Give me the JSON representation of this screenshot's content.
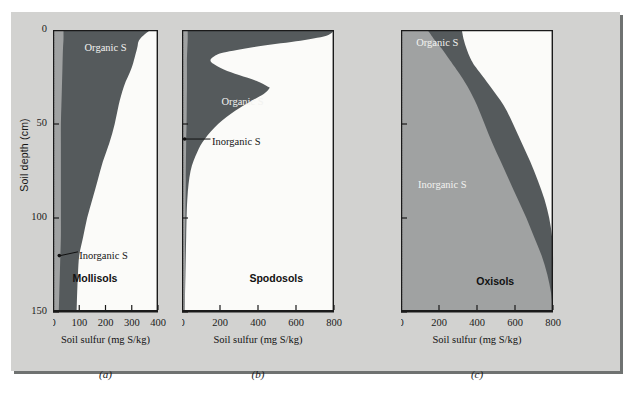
{
  "figure": {
    "y_axis_title": "Soil depth (cm)",
    "y_ticks": [
      "0",
      "50",
      "100",
      "150"
    ],
    "x_axis_title": "Soil sulfur (mg S/kg)",
    "colors": {
      "figure_background": "#d2d2d0",
      "organic_fill": "#555a5c",
      "inorganic_fill": "#a0a2a2",
      "plot_white": "#fbfbf9",
      "axis_line": "#1a1a1a"
    }
  },
  "panels": [
    {
      "caption": "(a)",
      "soil_type": "Mollisols",
      "organic_label": "Organic S",
      "inorganic_label": "Inorganic S",
      "x_ticks": [
        "0",
        "100",
        "200",
        "300",
        "400"
      ]
    },
    {
      "caption": "(b)",
      "soil_type": "Spodosols",
      "organic_label": "Organic S",
      "inorganic_label": "Inorganic S",
      "x_ticks": [
        "0",
        "200",
        "400",
        "600",
        "800"
      ]
    },
    {
      "caption": "(c)",
      "soil_type": "Oxisols",
      "organic_label": "Organic S",
      "inorganic_label": "Inorganic S",
      "x_ticks": [
        "0",
        "200",
        "400",
        "600",
        "800"
      ]
    }
  ],
  "chart_data": [
    {
      "type": "area",
      "title": "Mollisols",
      "panel": "(a)",
      "xlabel": "Soil sulfur (mg S/kg)",
      "ylabel": "Soil depth (cm)",
      "xlim": [
        0,
        400
      ],
      "ylim": [
        0,
        150
      ],
      "y_inverted": true,
      "xticks": [
        0,
        100,
        200,
        300,
        400
      ],
      "yticks": [
        0,
        50,
        100,
        150
      ],
      "grid": false,
      "legend": "in-plot annotations",
      "series": [
        {
          "name": "Inorganic S",
          "note": "narrow band along left axis; boundary x at each depth",
          "depth_cm": [
            0,
            5,
            10,
            20,
            30,
            40,
            50,
            60,
            70,
            80,
            90,
            100,
            110,
            120,
            130,
            140,
            150
          ],
          "values": [
            40,
            40,
            38,
            36,
            34,
            32,
            30,
            30,
            30,
            30,
            30,
            30,
            30,
            28,
            26,
            24,
            22
          ]
        },
        {
          "name": "Organic S",
          "note": "cumulative outer boundary (total S): organic occupies region between inorganic boundary and this curve",
          "depth_cm": [
            0,
            5,
            10,
            20,
            30,
            40,
            50,
            60,
            70,
            80,
            90,
            100,
            110,
            120,
            130,
            140,
            150
          ],
          "values": [
            370,
            330,
            320,
            300,
            270,
            250,
            235,
            215,
            190,
            170,
            150,
            130,
            115,
            100,
            95,
            92,
            90
          ]
        }
      ]
    },
    {
      "type": "area",
      "title": "Spodosols",
      "panel": "(b)",
      "xlabel": "Soil sulfur (mg S/kg)",
      "ylabel": "Soil depth (cm)",
      "xlim": [
        0,
        800
      ],
      "ylim": [
        0,
        150
      ],
      "y_inverted": true,
      "xticks": [
        0,
        200,
        400,
        600,
        800
      ],
      "yticks": [
        0,
        50,
        100,
        150
      ],
      "grid": false,
      "legend": "in-plot annotations",
      "series": [
        {
          "name": "Inorganic S",
          "note": "very narrow band hugging the left axis",
          "depth_cm": [
            0,
            5,
            10,
            15,
            20,
            25,
            30,
            40,
            50,
            60,
            80,
            100,
            120,
            150
          ],
          "values": [
            30,
            30,
            28,
            26,
            26,
            26,
            26,
            25,
            24,
            22,
            20,
            18,
            16,
            14
          ]
        },
        {
          "name": "Organic S",
          "note": "bimodal: surface maximum ~800, minimum ~150 near 16 cm, second (spodic) peak ~460 near 31 cm, decays to near zero by 75 cm",
          "depth_cm": [
            0,
            3,
            6,
            9,
            12,
            14,
            16,
            18,
            21,
            24,
            27,
            30,
            31,
            34,
            38,
            43,
            50,
            58,
            65,
            75,
            90,
            110,
            130,
            150
          ],
          "values": [
            800,
            760,
            600,
            380,
            220,
            170,
            150,
            165,
            220,
            300,
            390,
            450,
            460,
            430,
            360,
            280,
            190,
            120,
            80,
            45,
            28,
            22,
            18,
            14
          ]
        }
      ]
    },
    {
      "type": "area",
      "title": "Oxisols",
      "panel": "(c)",
      "xlabel": "Soil sulfur (mg S/kg)",
      "ylabel": "Soil depth (cm)",
      "xlim": [
        0,
        800
      ],
      "ylim": [
        0,
        150
      ],
      "y_inverted": true,
      "xticks": [
        0,
        200,
        400,
        600,
        800
      ],
      "yticks": [
        0,
        50,
        100,
        150
      ],
      "grid": false,
      "legend": "in-plot annotations",
      "series": [
        {
          "name": "Inorganic S",
          "note": "dominant fill increasing with depth; boundary between inorganic and organic",
          "depth_cm": [
            0,
            5,
            10,
            15,
            20,
            30,
            40,
            50,
            60,
            70,
            80,
            90,
            100,
            110,
            120,
            130,
            140,
            150
          ],
          "values": [
            140,
            175,
            215,
            250,
            285,
            350,
            400,
            440,
            480,
            525,
            570,
            615,
            660,
            700,
            740,
            770,
            790,
            800
          ]
        },
        {
          "name": "Organic S",
          "note": "outer total-S boundary; organic is the dark band between the inorganic boundary and this curve",
          "depth_cm": [
            0,
            5,
            10,
            15,
            20,
            30,
            40,
            50,
            60,
            70,
            80,
            90,
            100,
            110,
            120,
            130,
            140,
            150
          ],
          "values": [
            320,
            330,
            345,
            365,
            395,
            470,
            540,
            590,
            635,
            680,
            720,
            755,
            780,
            795,
            800,
            800,
            800,
            800
          ]
        }
      ]
    }
  ]
}
